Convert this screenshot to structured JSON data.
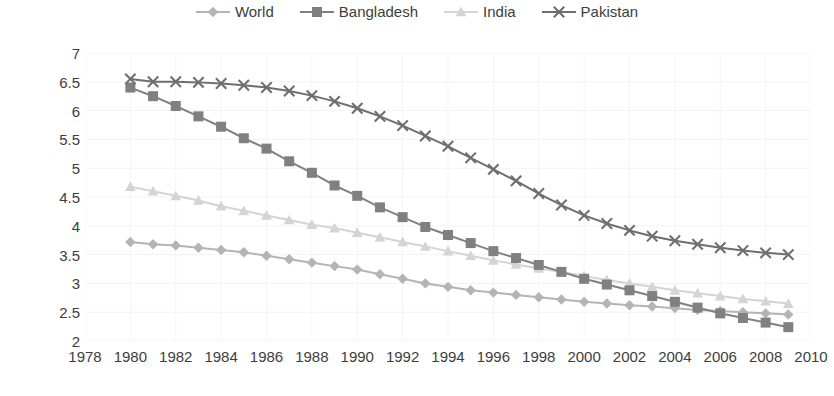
{
  "chart_data": {
    "type": "line",
    "title": "",
    "subtitle": "",
    "xlabel": "",
    "ylabel": "",
    "xlim": [
      1978,
      2010
    ],
    "ylim": [
      2,
      7
    ],
    "grid": true,
    "legend_position": "top-center",
    "x_ticks": [
      1978,
      1980,
      1982,
      1984,
      1986,
      1988,
      1990,
      1992,
      1994,
      1996,
      1998,
      2000,
      2002,
      2004,
      2006,
      2008,
      2010
    ],
    "y_ticks": [
      2,
      2.5,
      3,
      3.5,
      4,
      4.5,
      5,
      5.5,
      6,
      6.5,
      7
    ],
    "x": [
      1980,
      1981,
      1982,
      1983,
      1984,
      1985,
      1986,
      1987,
      1988,
      1989,
      1990,
      1991,
      1992,
      1993,
      1994,
      1995,
      1996,
      1997,
      1998,
      1999,
      2000,
      2001,
      2002,
      2003,
      2004,
      2005,
      2006,
      2007,
      2008,
      2009
    ],
    "series": [
      {
        "name": "World",
        "color": "#b4b4b4",
        "marker": "diamond",
        "values": [
          3.72,
          3.68,
          3.66,
          3.62,
          3.58,
          3.54,
          3.48,
          3.42,
          3.36,
          3.3,
          3.24,
          3.16,
          3.08,
          3.0,
          2.94,
          2.88,
          2.84,
          2.8,
          2.76,
          2.72,
          2.68,
          2.65,
          2.62,
          2.6,
          2.57,
          2.54,
          2.52,
          2.5,
          2.48,
          2.46
        ]
      },
      {
        "name": "Bangladesh",
        "color": "#808080",
        "marker": "square",
        "values": [
          6.4,
          6.25,
          6.08,
          5.9,
          5.72,
          5.52,
          5.34,
          5.12,
          4.92,
          4.7,
          4.52,
          4.32,
          4.15,
          3.98,
          3.84,
          3.7,
          3.56,
          3.44,
          3.32,
          3.2,
          3.08,
          2.98,
          2.88,
          2.78,
          2.68,
          2.58,
          2.48,
          2.4,
          2.32,
          2.24
        ]
      },
      {
        "name": "India",
        "color": "#d4d4d4",
        "marker": "triangle",
        "values": [
          4.68,
          4.6,
          4.52,
          4.44,
          4.34,
          4.26,
          4.18,
          4.1,
          4.02,
          3.96,
          3.88,
          3.8,
          3.72,
          3.64,
          3.56,
          3.48,
          3.4,
          3.33,
          3.26,
          3.2,
          3.13,
          3.06,
          3.0,
          2.94,
          2.88,
          2.83,
          2.78,
          2.73,
          2.69,
          2.65
        ]
      },
      {
        "name": "Pakistan",
        "color": "#6e6e6e",
        "marker": "cross",
        "values": [
          6.55,
          6.5,
          6.5,
          6.49,
          6.47,
          6.44,
          6.4,
          6.34,
          6.26,
          6.16,
          6.04,
          5.9,
          5.74,
          5.56,
          5.38,
          5.18,
          4.98,
          4.78,
          4.56,
          4.36,
          4.18,
          4.04,
          3.92,
          3.82,
          3.74,
          3.68,
          3.62,
          3.57,
          3.53,
          3.5
        ]
      }
    ]
  }
}
